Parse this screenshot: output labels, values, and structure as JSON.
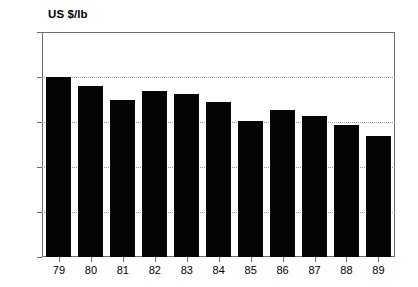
{
  "chart_data": {
    "type": "bar",
    "title": "",
    "subtitle": "",
    "xlabel": "",
    "ylabel": "US $/lb",
    "categories": [
      "79",
      "80",
      "81",
      "82",
      "83",
      "84",
      "85",
      "86",
      "87",
      "88",
      "89"
    ],
    "values": [
      4.0,
      3.79,
      3.49,
      3.69,
      3.62,
      3.45,
      3.02,
      3.27,
      3.14,
      2.94,
      2.69
    ],
    "series": [
      {
        "name": "US $/lb",
        "values": [
          4.0,
          3.79,
          3.49,
          3.69,
          3.62,
          3.45,
          3.02,
          3.27,
          3.14,
          2.94,
          2.69
        ]
      }
    ],
    "ylim": [
      0,
      5
    ],
    "yticks": [
      0,
      1,
      2,
      3,
      4,
      5
    ],
    "ytick_labels": [
      "0",
      "1",
      "2",
      "3",
      "4",
      "5"
    ],
    "grid": true,
    "grid_axis": "y",
    "legend": false,
    "legend_position": "none",
    "bar_color": "#050505",
    "grid_color": "#9a9a9a",
    "axis_color": "#6d6d6d",
    "background_color": "#ffffff",
    "annotations": []
  },
  "axis": {
    "unit_label": "US $/lb"
  }
}
